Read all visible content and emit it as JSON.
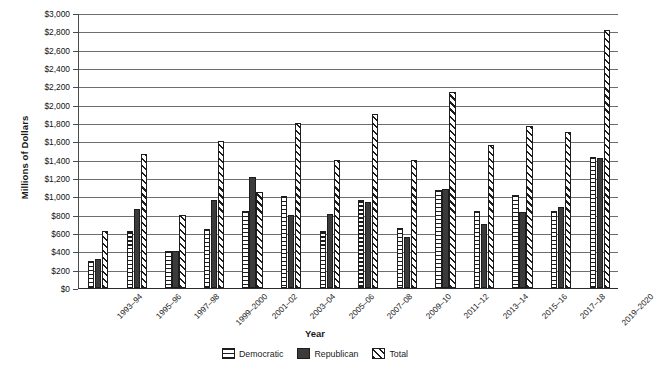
{
  "chart_data": {
    "type": "bar",
    "title": "",
    "xlabel": "Year",
    "ylabel": "Millions of Dollars",
    "ylim": [
      0,
      3000
    ],
    "yticks": [
      "$0",
      "$200",
      "$400",
      "$600",
      "$800",
      "$1,000",
      "$1,200",
      "$1,400",
      "$1,600",
      "$1,800",
      "$2,000",
      "$2,200",
      "$2,400",
      "$2,600",
      "$2,800",
      "$3,000"
    ],
    "ytick_values": [
      0,
      200,
      400,
      600,
      800,
      1000,
      1200,
      1400,
      1600,
      1800,
      2000,
      2200,
      2400,
      2600,
      2800,
      3000
    ],
    "grid": true,
    "legend_position": "bottom",
    "categories": [
      "1993–94",
      "1995–96",
      "1997–98",
      "1999–2000",
      "2001–02",
      "2003–04",
      "2005–06",
      "2007–08",
      "2009–10",
      "2011–12",
      "2013–14",
      "2015–16",
      "2017–18",
      "2019–2020"
    ],
    "series": [
      {
        "name": "Democratic",
        "pattern": "horizontal-lines",
        "values": [
          300,
          620,
          400,
          640,
          840,
          1000,
          620,
          960,
          660,
          1070,
          840,
          1020,
          840,
          1430
        ]
      },
      {
        "name": "Republican",
        "pattern": "solid-dark",
        "values": [
          320,
          860,
          400,
          960,
          1210,
          800,
          810,
          940,
          560,
          1080,
          700,
          830,
          880,
          1420
        ]
      },
      {
        "name": "Total",
        "pattern": "diagonal-hatch",
        "values": [
          620,
          1460,
          800,
          1600,
          1050,
          1800,
          1400,
          1900,
          1400,
          2140,
          1560,
          1770,
          1700,
          2820
        ]
      }
    ]
  },
  "legend": {
    "items": [
      {
        "label": "Democratic"
      },
      {
        "label": "Republican"
      },
      {
        "label": "Total"
      }
    ]
  }
}
